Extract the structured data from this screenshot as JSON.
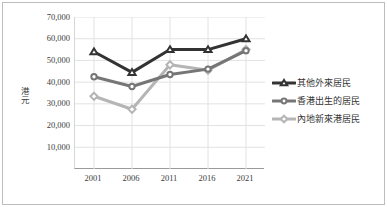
{
  "chart_data": {
    "type": "line",
    "title": "",
    "xlabel": "",
    "ylabel": "港元",
    "categories": [
      "2001",
      "2006",
      "2011",
      "2016",
      "2021"
    ],
    "ylim": [
      0,
      70000
    ],
    "ytick_labels": [
      "70,000",
      "60,000",
      "50,000",
      "40,000",
      "30,000",
      "20,000",
      "10,000"
    ],
    "ytick_values": [
      70000,
      60000,
      50000,
      40000,
      30000,
      20000,
      10000
    ],
    "grid": true,
    "legend_position": "right",
    "series": [
      {
        "name": "其他外來居民",
        "color": "#333333",
        "marker": "triangle",
        "values": [
          54000,
          44500,
          55000,
          55000,
          60000
        ]
      },
      {
        "name": "香港出生的居民",
        "color": "#767676",
        "marker": "circle",
        "values": [
          42500,
          38000,
          43500,
          46000,
          54500
        ]
      },
      {
        "name": "內地新來港居民",
        "color": "#b5b5b5",
        "marker": "diamond",
        "values": [
          33500,
          27500,
          48000,
          45500,
          55000
        ]
      }
    ]
  },
  "legend": {
    "items": [
      {
        "label": "其他外來居民"
      },
      {
        "label": "香港出生的居民"
      },
      {
        "label": "內地新來港居民"
      }
    ]
  },
  "axes": {
    "y_title": "港元"
  }
}
